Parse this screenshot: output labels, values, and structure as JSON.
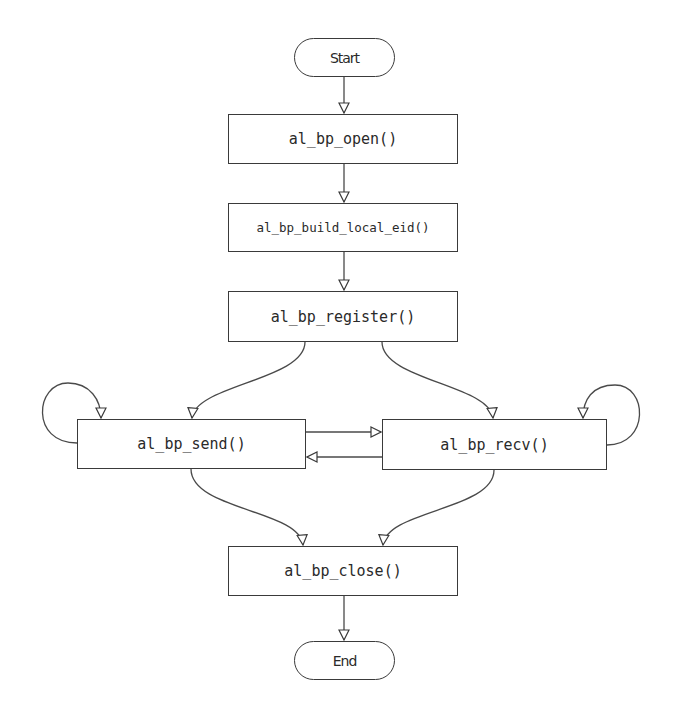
{
  "diagram": {
    "type": "flowchart",
    "colors": {
      "stroke": "#3a3a3a",
      "background": "#ffffff",
      "text": "#2a2a2a"
    },
    "nodes": {
      "start": {
        "label": "Start",
        "shape": "terminator"
      },
      "open": {
        "label": "al_bp_open()",
        "shape": "process"
      },
      "build_local_eid": {
        "label": "al_bp_build_local_eid()",
        "shape": "process"
      },
      "register": {
        "label": "al_bp_register()",
        "shape": "process"
      },
      "send": {
        "label": "al_bp_send()",
        "shape": "process"
      },
      "recv": {
        "label": "al_bp_recv()",
        "shape": "process"
      },
      "close": {
        "label": "al_bp_close()",
        "shape": "process"
      },
      "end": {
        "label": "End",
        "shape": "terminator"
      }
    },
    "edges": [
      {
        "from": "start",
        "to": "open"
      },
      {
        "from": "open",
        "to": "build_local_eid"
      },
      {
        "from": "build_local_eid",
        "to": "register"
      },
      {
        "from": "register",
        "to": "send"
      },
      {
        "from": "register",
        "to": "recv"
      },
      {
        "from": "send",
        "to": "send"
      },
      {
        "from": "recv",
        "to": "recv"
      },
      {
        "from": "send",
        "to": "recv"
      },
      {
        "from": "recv",
        "to": "send"
      },
      {
        "from": "send",
        "to": "close"
      },
      {
        "from": "recv",
        "to": "close"
      },
      {
        "from": "close",
        "to": "end"
      }
    ]
  }
}
